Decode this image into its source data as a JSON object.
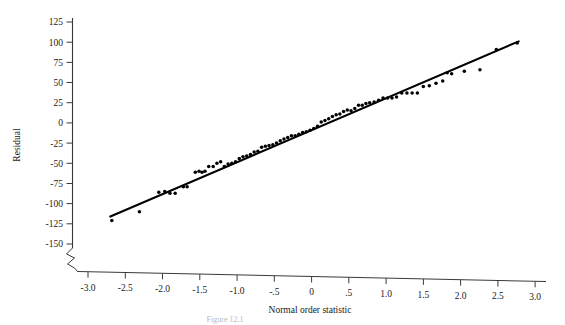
{
  "figure": {
    "caption_partial": "Figure 12.1",
    "background_color": "#ffffff",
    "ink_color": "#000000"
  },
  "chart_data": {
    "type": "scatter",
    "title": "",
    "subtitle": "",
    "xlabel": "Normal order statistic",
    "ylabel": "Residual",
    "xlim": [
      -3.0,
      3.0
    ],
    "ylim": [
      -150,
      125
    ],
    "grid": false,
    "legend": null,
    "axis_break": {
      "axis": "y",
      "symbol": "zigzag",
      "note": "break drawn below -150 where the y axis meets the x axis"
    },
    "xticks": [
      "-3.0",
      "-2.5",
      "-2.0",
      "-1.5",
      "-1.0",
      "-.5",
      "0",
      ".5",
      "1.0",
      "1.5",
      "2.0",
      "2.5",
      "3.0"
    ],
    "xtick_values": [
      -3.0,
      -2.5,
      -2.0,
      -1.5,
      -1.0,
      -0.5,
      0,
      0.5,
      1.0,
      1.5,
      2.0,
      2.5,
      3.0
    ],
    "yticks": [
      "125",
      "100",
      "75",
      "50",
      "25",
      "0",
      "-25",
      "-50",
      "-75",
      "-100",
      "-125",
      "-150"
    ],
    "ytick_values": [
      125,
      100,
      75,
      50,
      25,
      0,
      -25,
      -50,
      -75,
      -100,
      -125,
      -150
    ],
    "reference_line": {
      "name": "normal reference line",
      "x": [
        -2.7,
        2.78
      ],
      "y": [
        -116,
        101
      ]
    },
    "series": [
      {
        "name": "Residuals vs normal order statistic",
        "marker": "filled-circle",
        "color": "#000000",
        "points": [
          [
            -2.68,
            -121
          ],
          [
            -2.31,
            -110
          ],
          [
            -2.05,
            -86
          ],
          [
            -1.97,
            -85
          ],
          [
            -1.9,
            -87
          ],
          [
            -1.83,
            -87
          ],
          [
            -1.72,
            -79
          ],
          [
            -1.67,
            -79
          ],
          [
            -1.56,
            -61
          ],
          [
            -1.51,
            -60
          ],
          [
            -1.47,
            -61
          ],
          [
            -1.43,
            -60
          ],
          [
            -1.38,
            -54
          ],
          [
            -1.32,
            -54
          ],
          [
            -1.27,
            -50
          ],
          [
            -1.22,
            -48
          ],
          [
            -1.17,
            -54
          ],
          [
            -1.12,
            -51
          ],
          [
            -1.07,
            -50
          ],
          [
            -1.02,
            -48
          ],
          [
            -0.97,
            -44
          ],
          [
            -0.92,
            -42
          ],
          [
            -0.87,
            -41
          ],
          [
            -0.82,
            -39
          ],
          [
            -0.77,
            -36
          ],
          [
            -0.72,
            -35
          ],
          [
            -0.67,
            -30
          ],
          [
            -0.62,
            -29
          ],
          [
            -0.57,
            -28
          ],
          [
            -0.52,
            -27
          ],
          [
            -0.47,
            -25
          ],
          [
            -0.42,
            -22
          ],
          [
            -0.37,
            -20
          ],
          [
            -0.32,
            -18
          ],
          [
            -0.27,
            -16
          ],
          [
            -0.22,
            -16
          ],
          [
            -0.17,
            -14
          ],
          [
            -0.12,
            -12
          ],
          [
            -0.07,
            -11
          ],
          [
            -0.02,
            -9
          ],
          [
            0.03,
            -7
          ],
          [
            0.08,
            -4
          ],
          [
            0.13,
            1
          ],
          [
            0.18,
            3
          ],
          [
            0.23,
            5
          ],
          [
            0.28,
            8
          ],
          [
            0.33,
            10
          ],
          [
            0.38,
            11
          ],
          [
            0.43,
            14
          ],
          [
            0.48,
            16
          ],
          [
            0.53,
            15
          ],
          [
            0.58,
            18
          ],
          [
            0.63,
            22
          ],
          [
            0.68,
            22
          ],
          [
            0.73,
            24
          ],
          [
            0.78,
            25
          ],
          [
            0.84,
            26
          ],
          [
            0.9,
            28
          ],
          [
            0.96,
            31
          ],
          [
            1.02,
            31
          ],
          [
            1.08,
            31
          ],
          [
            1.14,
            32
          ],
          [
            1.21,
            37
          ],
          [
            1.28,
            37
          ],
          [
            1.35,
            37
          ],
          [
            1.42,
            37
          ],
          [
            1.5,
            45
          ],
          [
            1.58,
            46
          ],
          [
            1.67,
            49
          ],
          [
            1.76,
            52
          ],
          [
            1.82,
            62
          ],
          [
            1.88,
            61
          ],
          [
            2.05,
            64
          ],
          [
            2.26,
            66
          ],
          [
            2.48,
            91
          ],
          [
            2.76,
            99
          ]
        ]
      }
    ]
  }
}
